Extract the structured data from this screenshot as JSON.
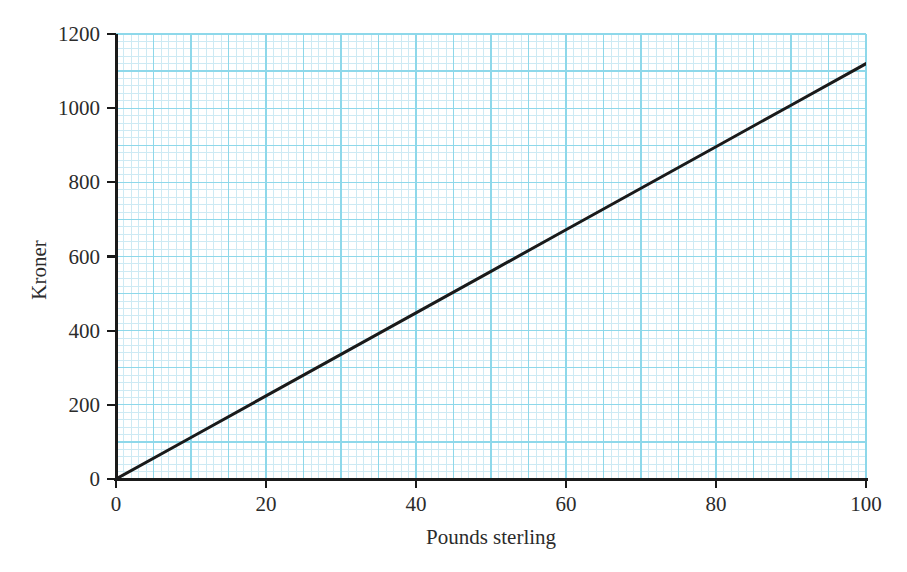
{
  "chart_data": {
    "type": "line",
    "title": "",
    "subtitle": "",
    "xlabel": "Pounds sterling",
    "ylabel": "Kroner",
    "xlim": [
      0,
      100
    ],
    "ylim": [
      0,
      1200
    ],
    "xticks": [
      0,
      20,
      40,
      60,
      80,
      100
    ],
    "yticks": [
      0,
      200,
      400,
      600,
      800,
      1000,
      1200
    ],
    "xtick_labels": [
      "0",
      "20",
      "40",
      "60",
      "80",
      "100"
    ],
    "ytick_labels": [
      "0",
      "200",
      "400",
      "600",
      "800",
      "1000",
      "1200"
    ],
    "x_minor_step": 1,
    "x_major_step": 5,
    "y_minor_step": 20,
    "y_major_step": 100,
    "grid": true,
    "grid_color": "#8ed8ea",
    "grid_minor_color": "#cdeaf4",
    "legend": false,
    "legend_position": "none",
    "line_color": "#1a1a1a",
    "line_width": 3,
    "annotations": [],
    "series": [
      {
        "name": "Conversion rate",
        "slope": 11.2,
        "intercept": 0,
        "x": [
          0,
          10,
          20,
          30,
          40,
          50,
          60,
          70,
          80,
          90,
          100
        ],
        "values": [
          0,
          112,
          224,
          336,
          448,
          560,
          672,
          784,
          896,
          1008,
          1120
        ]
      }
    ]
  },
  "axes": {
    "x_title": "Pounds sterling",
    "y_title": "Kroner"
  }
}
